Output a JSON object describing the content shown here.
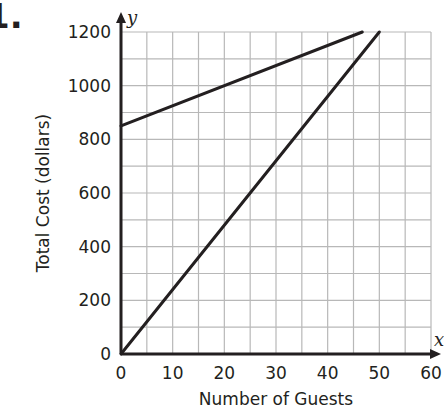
{
  "problem": {
    "label": "1."
  },
  "chart_data": {
    "type": "line",
    "title": "",
    "xlabel": "Number of Guests",
    "ylabel": "Total Cost (dollars)",
    "x_axis_variable": "x",
    "y_axis_variable": "y",
    "xlim": [
      0,
      60
    ],
    "ylim": [
      0,
      1200
    ],
    "x_ticks": [
      0,
      10,
      20,
      30,
      40,
      50,
      60
    ],
    "y_ticks": [
      0,
      200,
      400,
      600,
      800,
      1000,
      1200
    ],
    "x_tick_labels": [
      "0",
      "10",
      "20",
      "30",
      "40",
      "50",
      "60"
    ],
    "y_tick_labels": [
      "0",
      "200",
      "400",
      "600",
      "800",
      "1000",
      "1200"
    ],
    "grid": true,
    "grid_x_step": 5,
    "grid_y_step": 100,
    "legend": null,
    "series": [
      {
        "name": "Line A (flatter)",
        "equation": "y = 7.5x + 850",
        "points": [
          [
            0,
            850
          ],
          [
            46.7,
            1200
          ]
        ],
        "color": "#231f20"
      },
      {
        "name": "Line B (steeper)",
        "equation": "y = 24x",
        "points": [
          [
            0,
            0
          ],
          [
            50,
            1200
          ]
        ],
        "color": "#231f20"
      }
    ]
  },
  "colors": {
    "ink": "#231f20",
    "grid": "#b8b8b8"
  }
}
